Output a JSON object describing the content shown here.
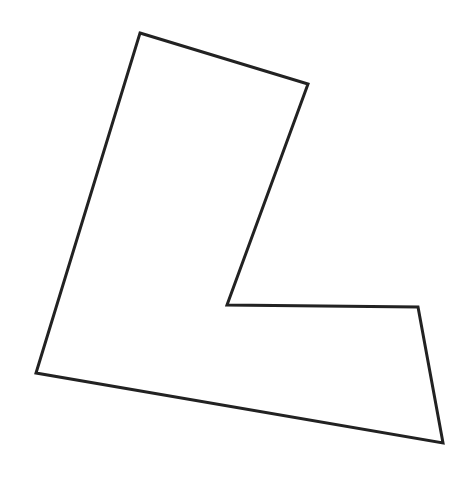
{
  "figure": {
    "shape": "L-shaped hexagon",
    "stroke_color": "#222222",
    "fill_color": "none",
    "stroke_width": 3,
    "vertices": [
      [
        140,
        33
      ],
      [
        308,
        84
      ],
      [
        227,
        305
      ],
      [
        418,
        307
      ],
      [
        443,
        443
      ],
      [
        36,
        373
      ]
    ]
  }
}
